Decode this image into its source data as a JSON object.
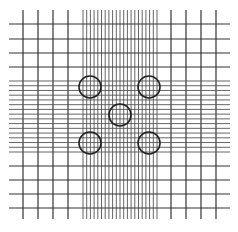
{
  "diagram": {
    "type": "grid-with-circles",
    "width": 238,
    "height": 232,
    "background": "#ffffff",
    "line_color": "#333333",
    "dense_line_color": "#555555",
    "circle_color": "#222222",
    "vertical_lines": {
      "y_start": 10,
      "y_end": 219,
      "sparse_left": [
        23,
        38,
        53,
        68
      ],
      "dense": {
        "start": 83,
        "end": 157,
        "count": 21
      },
      "sparse_right": [
        171,
        186,
        201,
        216
      ]
    },
    "horizontal_lines": {
      "x_start": 9,
      "x_end": 230,
      "sparse_top": [
        24,
        39,
        53,
        67
      ],
      "dense": {
        "start": 81,
        "end": 152,
        "count": 16
      },
      "sparse_bottom": [
        166,
        180,
        194,
        208
      ]
    },
    "circles": [
      {
        "name": "top-left",
        "cx": 90,
        "cy": 87,
        "r": 11
      },
      {
        "name": "top-right",
        "cx": 149,
        "cy": 87,
        "r": 11
      },
      {
        "name": "center",
        "cx": 120,
        "cy": 115,
        "r": 11
      },
      {
        "name": "bottom-left",
        "cx": 90,
        "cy": 143,
        "r": 11
      },
      {
        "name": "bottom-right",
        "cx": 149,
        "cy": 143,
        "r": 11
      }
    ]
  }
}
